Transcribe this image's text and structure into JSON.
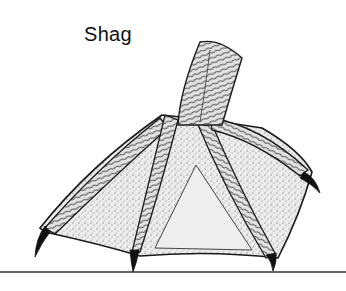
{
  "figure": {
    "label": "Shag",
    "style": "pen-and-ink stipple drawing",
    "colors": {
      "ink": "#1a1a1a",
      "web_fill": "#e9e9e9",
      "toe_fill": "#dcdcdc",
      "ground": "#333333",
      "background": "#ffffff"
    }
  }
}
